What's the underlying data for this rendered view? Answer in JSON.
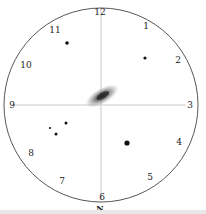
{
  "sketch": {
    "field_circle": {
      "cx": 101,
      "cy": 105,
      "r": 97,
      "color": "#444444"
    },
    "crosshair_color": "#bbbbbb",
    "clock_labels": [
      {
        "text": "12",
        "x": 100,
        "y": 12
      },
      {
        "text": "1",
        "x": 146,
        "y": 26
      },
      {
        "text": "2",
        "x": 178,
        "y": 60
      },
      {
        "text": "3",
        "x": 190,
        "y": 105
      },
      {
        "text": "4",
        "x": 179,
        "y": 142
      },
      {
        "text": "5",
        "x": 150,
        "y": 177
      },
      {
        "text": "6",
        "x": 102,
        "y": 197
      },
      {
        "text": "7",
        "x": 62,
        "y": 181
      },
      {
        "text": "8",
        "x": 31,
        "y": 153
      },
      {
        "text": "9",
        "x": 12,
        "y": 105
      },
      {
        "text": "10",
        "x": 26,
        "y": 65
      },
      {
        "text": "11",
        "x": 55,
        "y": 30
      }
    ],
    "direction_label": {
      "text": "N",
      "x": 100,
      "y": 208
    },
    "galaxy": {
      "cx": 102,
      "cy": 96,
      "rx": 19,
      "ry": 7,
      "angle": -30
    },
    "stars": [
      {
        "x": 67,
        "y": 43,
        "r": 1.8
      },
      {
        "x": 145,
        "y": 58,
        "r": 1.6
      },
      {
        "x": 66,
        "y": 123,
        "r": 1.5
      },
      {
        "x": 50,
        "y": 128,
        "r": 1.1
      },
      {
        "x": 56,
        "y": 134,
        "r": 1.5
      },
      {
        "x": 127,
        "y": 143,
        "r": 2.6
      }
    ]
  }
}
